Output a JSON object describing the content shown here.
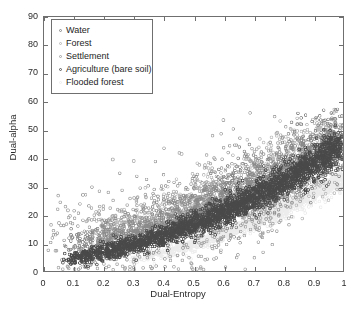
{
  "chart_data": {
    "type": "scatter",
    "title": "",
    "xlabel": "Dual-Entropy",
    "ylabel": "Dual-alpha",
    "xlim": [
      0,
      1
    ],
    "ylim": [
      0,
      90
    ],
    "xticks": [
      0,
      0.1,
      0.2,
      0.3,
      0.4,
      0.5,
      0.6,
      0.7,
      0.8,
      0.9,
      1
    ],
    "xticklabels": [
      "0",
      "0.1",
      "0.2",
      "0.3",
      "0.4",
      "0.5",
      "0.6",
      "0.7",
      "0.8",
      "0.9",
      "1"
    ],
    "yticks": [
      0,
      10,
      20,
      30,
      40,
      50,
      60,
      70,
      80,
      90
    ],
    "yticklabels": [
      "0",
      "10",
      "20",
      "30",
      "40",
      "50",
      "60",
      "70",
      "80",
      "90"
    ],
    "grid": false,
    "marker": "circle-open",
    "marker_size": 2.2,
    "legend_position": "upper-left",
    "series": [
      {
        "name": "Water",
        "color": "#8a8a8a",
        "count": 1500,
        "shape": "arc-band",
        "params": {
          "x0": 0.07,
          "x1": 1.0,
          "a": 7.0,
          "b": 16.0,
          "c": 24.0,
          "spread_y": 3.4,
          "spread_x": 0.018,
          "jitter_hi": 4.5
        }
      },
      {
        "name": "Forest",
        "color": "#b9b9b9",
        "count": 1200,
        "shape": "arc-band",
        "params": {
          "x0": 0.12,
          "x1": 1.0,
          "a": 9.5,
          "b": 10.0,
          "c": 28.0,
          "spread_y": 4.0,
          "spread_x": 0.02,
          "jitter_hi": 5.5
        }
      },
      {
        "name": "Settlement",
        "color": "#a3a3a3",
        "count": 900,
        "shape": "scatter-cloud",
        "params": {
          "x0": 0.04,
          "x1": 0.78,
          "a": 6.0,
          "b": 22.0,
          "c": 8.0,
          "spread_y": 7.5,
          "spread_x": 0.05,
          "jitter_hi": 9.0
        }
      },
      {
        "name": "Agriculture (bare soil)",
        "color": "#4a4a4a",
        "count": 2600,
        "shape": "dense-band",
        "params": {
          "x0": 0.08,
          "x1": 1.0,
          "a": 3.0,
          "b": 12.0,
          "c": 30.0,
          "spread_y": 2.0,
          "spread_x": 0.012,
          "jitter_hi": 2.6
        }
      },
      {
        "name": "Flooded forest",
        "color": "#ececec",
        "count": 1400,
        "shape": "lower-edge",
        "params": {
          "x0": 0.28,
          "x1": 1.0,
          "a": 1.0,
          "b": 4.5,
          "c": 30.0,
          "spread_y": 1.6,
          "spread_x": 0.015,
          "jitter_hi": 2.0
        }
      }
    ],
    "outliers": [
      {
        "x": 0.23,
        "y": 39.5,
        "color": "#a3a3a3"
      },
      {
        "x": 0.3,
        "y": 39.0,
        "color": "#a3a3a3"
      },
      {
        "x": 0.6,
        "y": 53.5,
        "color": "#a3a3a3"
      },
      {
        "x": 0.46,
        "y": 41.5,
        "color": "#a3a3a3"
      },
      {
        "x": 0.13,
        "y": 27.0,
        "color": "#a3a3a3"
      },
      {
        "x": 0.08,
        "y": 21.5,
        "color": "#a3a3a3"
      },
      {
        "x": 0.05,
        "y": 17.0,
        "color": "#a3a3a3"
      },
      {
        "x": 0.78,
        "y": 49.0,
        "color": "#a3a3a3"
      },
      {
        "x": 0.86,
        "y": 52.0,
        "color": "#8a8a8a"
      },
      {
        "x": 0.95,
        "y": 49.0,
        "color": "#8a8a8a"
      }
    ]
  },
  "legend": {
    "items": [
      {
        "label": "Water",
        "color": "#8a8a8a"
      },
      {
        "label": "Forest",
        "color": "#b9b9b9"
      },
      {
        "label": "Settlement",
        "color": "#a3a3a3"
      },
      {
        "label": "Agriculture (bare soil)",
        "color": "#5a5a5a"
      },
      {
        "label": "Flooded forest",
        "color": "#ededed"
      }
    ]
  },
  "axes": {
    "x_title": "Dual-Entropy",
    "y_title": "Dual-alpha"
  },
  "colors": {
    "background": "#ffffff",
    "axis": "#6f6f6f",
    "text": "#2b2b2b"
  }
}
